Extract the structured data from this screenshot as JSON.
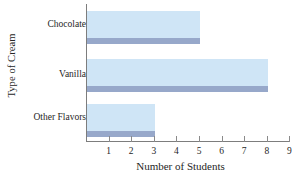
{
  "chart_data": {
    "type": "bar",
    "orientation": "horizontal",
    "title": "",
    "xlabel": "Number of Students",
    "ylabel": "Type of Cream",
    "categories": [
      "Chocolate",
      "Vanilla",
      "Other Flavors"
    ],
    "values": [
      5,
      8,
      3
    ],
    "series": [
      {
        "name": "Number of Students",
        "values": [
          5,
          8,
          3
        ]
      }
    ],
    "xlim": [
      0,
      9
    ],
    "ylim": [
      0,
      3
    ],
    "xticks": [
      1,
      2,
      3,
      4,
      5,
      6,
      7,
      8,
      9
    ],
    "xtick_labels": [
      "1",
      "2",
      "3",
      "4",
      "5",
      "6",
      "7",
      "8",
      "9"
    ],
    "grid": false,
    "legend": false,
    "legend_position": "none",
    "bar_fill_color": "#cfe5f6",
    "bar_edge_color": "#97a8ca",
    "axis_color": "#7d7d7d",
    "background_color": "#ffffff",
    "text_color": "#262626"
  }
}
